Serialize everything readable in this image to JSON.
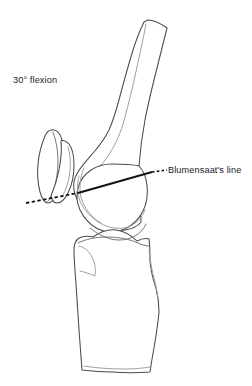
{
  "figure": {
    "background_color": "#ffffff",
    "outline_color": "#4a4a4f",
    "inner_line_color": "#6f6f77",
    "reference_line_color": "#131316",
    "width": 252,
    "height": 386
  },
  "annotations": {
    "flexion": {
      "text": "30° flexion",
      "x": 13,
      "y": 76
    },
    "blumensaat": {
      "text": "Blumensaat's line",
      "x": 168,
      "y": 166
    }
  },
  "structures": {
    "femur": {
      "name": "femur",
      "label": "Femur (distal shaft and condyle)"
    },
    "patella": {
      "name": "patella",
      "label": "Patella"
    },
    "femoral_condyle": {
      "name": "femoral-condyle",
      "label": "Femoral condyle"
    },
    "trochlea": {
      "name": "trochlear-groove",
      "label": "Trochlear groove"
    },
    "tibia": {
      "name": "tibia",
      "label": "Tibia with tibial plateau and tubercle"
    }
  },
  "reference_lines": {
    "blumensaat_solid": {
      "name": "blumensaat-line-solid",
      "style": "solid"
    },
    "blumensaat_dashed_left": {
      "name": "blumensaat-line-dashed-left",
      "style": "dashed"
    },
    "blumensaat_dotted_right": {
      "name": "blumensaat-line-dotted-right",
      "style": "dotted"
    }
  }
}
